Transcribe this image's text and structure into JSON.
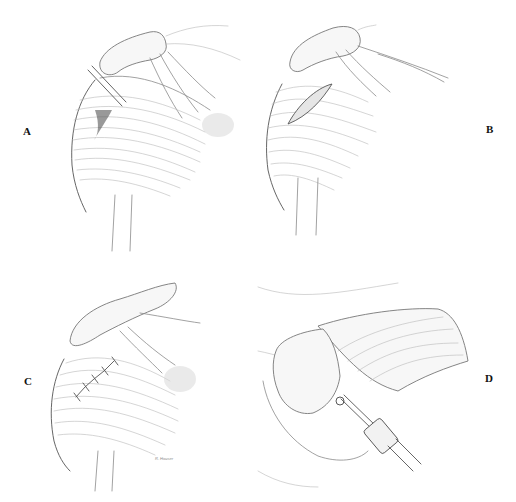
{
  "figure": {
    "panels": [
      {
        "id": "A",
        "label": "A",
        "description": "Shoulder with instrument inserted into rotator cuff region"
      },
      {
        "id": "B",
        "label": "B",
        "description": "Shoulder with elliptical incision in deltoid"
      },
      {
        "id": "C",
        "label": "C",
        "description": "Shoulder with sutured repair along deltoid"
      },
      {
        "id": "D",
        "label": "D",
        "description": "Arthroscopic view with instrument at humeral head"
      }
    ],
    "signature": "R. Houser"
  }
}
